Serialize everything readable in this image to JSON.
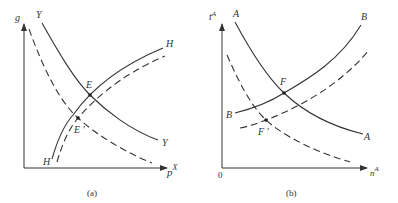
{
  "panels": [
    {
      "caption": "(a)",
      "y_axis_label": "g",
      "x_axis_label": "p",
      "x_axis_label_sup": "X",
      "curves": {
        "Y": {
          "label_top": "Y",
          "label_end": "Y",
          "style": "solid"
        },
        "Y_shifted": {
          "style": "dashed"
        },
        "H": {
          "label_end": "H",
          "label_start": "H",
          "style": "solid"
        },
        "H_shifted": {
          "style": "dashed"
        }
      },
      "points": {
        "E": "E",
        "E_prime": "E '"
      }
    },
    {
      "caption": "(b)",
      "y_axis_label": "t",
      "y_axis_label_sup": "A",
      "x_axis_label": "n",
      "x_axis_label_sup": "A",
      "origin_label": "0",
      "curves": {
        "A": {
          "label_top": "A",
          "label_end": "A",
          "style": "solid"
        },
        "A_shifted": {
          "style": "dashed"
        },
        "B": {
          "label_end": "B",
          "label_start": "B",
          "style": "solid"
        },
        "B_shifted": {
          "style": "dashed"
        }
      },
      "points": {
        "F": "F",
        "F_prime": "F '"
      }
    }
  ]
}
